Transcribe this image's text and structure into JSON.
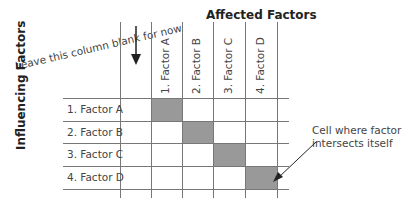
{
  "note": "Leave this column blank for now",
  "title_top": "Affected Factors",
  "title_left": "Influencing Factors",
  "rows": [
    "1. Factor A",
    "2. Factor B",
    "3. Factor C",
    "4. Factor D"
  ],
  "columns": [
    "1. Factor A",
    "2. Factor B",
    "3. Factor C",
    "4. Factor D"
  ],
  "callout": {
    "line1": "Cell where factor",
    "line2": "intersects itself"
  },
  "colors": {
    "diagonal_cell": "#999999",
    "grid": "#777777"
  }
}
